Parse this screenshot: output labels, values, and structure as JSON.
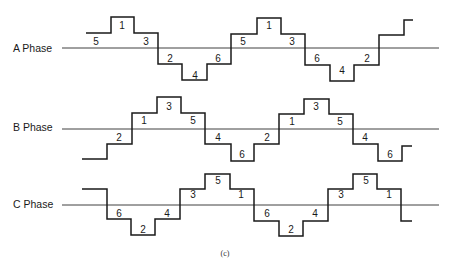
{
  "figure": {
    "caption": "(c)",
    "axis_x_start": 62,
    "axis_x_end": 439,
    "level_labels_note": "numbers indicate switching interval/step index"
  },
  "phases": [
    {
      "name": "A Phase",
      "label_x": 13,
      "label_y": 52,
      "axis_y": 48,
      "points": [
        [
          86,
          33
        ],
        [
          111,
          33
        ],
        [
          111,
          17
        ],
        [
          134,
          17
        ],
        [
          134,
          33
        ],
        [
          158,
          33
        ],
        [
          158,
          64
        ],
        [
          182,
          64
        ],
        [
          182,
          80
        ],
        [
          207,
          80
        ],
        [
          207,
          64
        ],
        [
          231,
          64
        ],
        [
          231,
          34
        ],
        [
          257,
          34
        ],
        [
          257,
          18
        ],
        [
          281,
          18
        ],
        [
          281,
          34
        ],
        [
          305,
          34
        ],
        [
          305,
          65
        ],
        [
          330,
          65
        ],
        [
          330,
          81
        ],
        [
          354,
          81
        ],
        [
          354,
          65
        ],
        [
          379,
          65
        ],
        [
          379,
          35
        ],
        [
          404,
          35
        ],
        [
          404,
          20
        ],
        [
          413,
          20
        ]
      ],
      "step_labels": [
        {
          "text": "5",
          "x": 96,
          "y": 45
        },
        {
          "text": "1",
          "x": 122,
          "y": 29
        },
        {
          "text": "3",
          "x": 146,
          "y": 45
        },
        {
          "text": "2",
          "x": 170,
          "y": 62
        },
        {
          "text": "4",
          "x": 195,
          "y": 79
        },
        {
          "text": "6",
          "x": 218,
          "y": 62
        },
        {
          "text": "5",
          "x": 243,
          "y": 45
        },
        {
          "text": "1",
          "x": 269,
          "y": 29
        },
        {
          "text": "3",
          "x": 292,
          "y": 45
        },
        {
          "text": "6",
          "x": 317,
          "y": 62
        },
        {
          "text": "4",
          "x": 342,
          "y": 74
        },
        {
          "text": "2",
          "x": 367,
          "y": 62
        }
      ]
    },
    {
      "name": "B Phase",
      "label_x": 13,
      "label_y": 131,
      "axis_y": 129,
      "points": [
        [
          82,
          159
        ],
        [
          107,
          159
        ],
        [
          107,
          144
        ],
        [
          132,
          144
        ],
        [
          132,
          113
        ],
        [
          157,
          113
        ],
        [
          157,
          97
        ],
        [
          181,
          97
        ],
        [
          181,
          113
        ],
        [
          205,
          113
        ],
        [
          205,
          144
        ],
        [
          231,
          144
        ],
        [
          231,
          161
        ],
        [
          254,
          161
        ],
        [
          254,
          144
        ],
        [
          279,
          144
        ],
        [
          279,
          114
        ],
        [
          304,
          114
        ],
        [
          304,
          99
        ],
        [
          329,
          99
        ],
        [
          329,
          114
        ],
        [
          353,
          114
        ],
        [
          353,
          144
        ],
        [
          378,
          144
        ],
        [
          378,
          161
        ],
        [
          402,
          161
        ],
        [
          402,
          146
        ],
        [
          412,
          146
        ]
      ],
      "step_labels": [
        {
          "text": "2",
          "x": 119,
          "y": 141
        },
        {
          "text": "1",
          "x": 144,
          "y": 124
        },
        {
          "text": "3",
          "x": 169,
          "y": 110
        },
        {
          "text": "5",
          "x": 193,
          "y": 124
        },
        {
          "text": "4",
          "x": 218,
          "y": 141
        },
        {
          "text": "6",
          "x": 242,
          "y": 158
        },
        {
          "text": "2",
          "x": 267,
          "y": 141
        },
        {
          "text": "1",
          "x": 292,
          "y": 125
        },
        {
          "text": "3",
          "x": 316,
          "y": 110
        },
        {
          "text": "5",
          "x": 340,
          "y": 125
        },
        {
          "text": "4",
          "x": 365,
          "y": 141
        },
        {
          "text": "6",
          "x": 390,
          "y": 158
        }
      ]
    },
    {
      "name": "C Phase",
      "label_x": 13,
      "label_y": 208,
      "axis_y": 205,
      "points": [
        [
          82,
          189
        ],
        [
          107,
          189
        ],
        [
          107,
          219
        ],
        [
          131,
          219
        ],
        [
          131,
          235
        ],
        [
          155,
          235
        ],
        [
          155,
          219
        ],
        [
          180,
          219
        ],
        [
          180,
          189
        ],
        [
          205,
          189
        ],
        [
          205,
          174
        ],
        [
          230,
          174
        ],
        [
          230,
          189
        ],
        [
          254,
          189
        ],
        [
          254,
          221
        ],
        [
          279,
          221
        ],
        [
          279,
          236
        ],
        [
          303,
          236
        ],
        [
          303,
          221
        ],
        [
          328,
          221
        ],
        [
          328,
          189
        ],
        [
          353,
          189
        ],
        [
          353,
          174
        ],
        [
          377,
          174
        ],
        [
          377,
          189
        ],
        [
          401,
          189
        ],
        [
          401,
          221
        ],
        [
          412,
          221
        ]
      ],
      "step_labels": [
        {
          "text": "6",
          "x": 119,
          "y": 217
        },
        {
          "text": "2",
          "x": 143,
          "y": 233
        },
        {
          "text": "4",
          "x": 167,
          "y": 217
        },
        {
          "text": "3",
          "x": 193,
          "y": 198
        },
        {
          "text": "5",
          "x": 218,
          "y": 184
        },
        {
          "text": "1",
          "x": 241,
          "y": 198
        },
        {
          "text": "6",
          "x": 267,
          "y": 217
        },
        {
          "text": "2",
          "x": 291,
          "y": 233
        },
        {
          "text": "4",
          "x": 315,
          "y": 217
        },
        {
          "text": "3",
          "x": 341,
          "y": 198
        },
        {
          "text": "5",
          "x": 366,
          "y": 184
        },
        {
          "text": "1",
          "x": 389,
          "y": 198
        }
      ]
    }
  ]
}
